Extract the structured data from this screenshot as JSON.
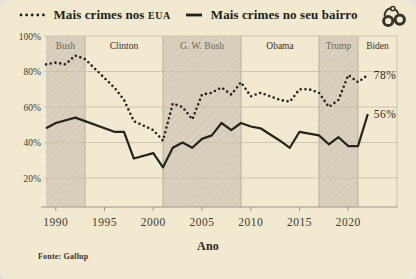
{
  "legend": {
    "icon": "handcuffs-icon",
    "series1": {
      "label": "Mais crimes nos",
      "suffix": "EUA"
    },
    "series2": {
      "label": "Mais crimes no seu bairro"
    }
  },
  "chart_data": {
    "type": "line",
    "xlabel": "Ano",
    "source": "Fonte: Gallup",
    "xlim": [
      1989,
      2025
    ],
    "ylim": [
      0,
      100
    ],
    "x_ticks": [
      1990,
      1995,
      2000,
      2005,
      2010,
      2015,
      2020
    ],
    "y_ticks": [
      20,
      40,
      60,
      80,
      100
    ],
    "y_tick_suffix": "%",
    "grid": "horizontal",
    "legend_position": "top",
    "bands": [
      {
        "label": "Bush",
        "start": 1989,
        "end": 1993,
        "shaded": true
      },
      {
        "label": "Clinton",
        "start": 1993,
        "end": 2001,
        "shaded": false
      },
      {
        "label": "G. W. Bush",
        "start": 2001,
        "end": 2009,
        "shaded": true
      },
      {
        "label": "Obama",
        "start": 2009,
        "end": 2017,
        "shaded": false
      },
      {
        "label": "Trump",
        "start": 2017,
        "end": 2021,
        "shaded": true
      },
      {
        "label": "Biden",
        "start": 2021,
        "end": 2025,
        "shaded": false
      }
    ],
    "series": [
      {
        "name": "Mais crimes nos EUA",
        "style": "dotted",
        "end_label": "78%",
        "points": [
          [
            1989,
            84
          ],
          [
            1990,
            85
          ],
          [
            1991,
            84
          ],
          [
            1992,
            89
          ],
          [
            1993,
            87
          ],
          [
            1996,
            71
          ],
          [
            1997,
            64
          ],
          [
            1998,
            52
          ],
          [
            2000,
            47
          ],
          [
            2001,
            41
          ],
          [
            2002,
            62
          ],
          [
            2003,
            60
          ],
          [
            2004,
            53
          ],
          [
            2005,
            67
          ],
          [
            2006,
            68
          ],
          [
            2007,
            71
          ],
          [
            2008,
            67
          ],
          [
            2009,
            74
          ],
          [
            2010,
            66
          ],
          [
            2011,
            68
          ],
          [
            2013,
            64
          ],
          [
            2014,
            63
          ],
          [
            2015,
            70
          ],
          [
            2016,
            70
          ],
          [
            2017,
            68
          ],
          [
            2018,
            60
          ],
          [
            2019,
            64
          ],
          [
            2020,
            78
          ],
          [
            2021,
            74
          ],
          [
            2022,
            78
          ]
        ]
      },
      {
        "name": "Mais crimes no seu bairro",
        "style": "solid",
        "end_label": "56%",
        "points": [
          [
            1989,
            48
          ],
          [
            1990,
            51
          ],
          [
            1992,
            54
          ],
          [
            1996,
            46
          ],
          [
            1997,
            46
          ],
          [
            1998,
            31
          ],
          [
            2000,
            34
          ],
          [
            2001,
            26
          ],
          [
            2002,
            37
          ],
          [
            2003,
            40
          ],
          [
            2004,
            37
          ],
          [
            2005,
            42
          ],
          [
            2006,
            44
          ],
          [
            2007,
            51
          ],
          [
            2008,
            47
          ],
          [
            2009,
            51
          ],
          [
            2010,
            49
          ],
          [
            2011,
            48
          ],
          [
            2013,
            41
          ],
          [
            2014,
            37
          ],
          [
            2015,
            46
          ],
          [
            2016,
            45
          ],
          [
            2017,
            44
          ],
          [
            2018,
            39
          ],
          [
            2019,
            43
          ],
          [
            2020,
            38
          ],
          [
            2021,
            38
          ],
          [
            2022,
            56
          ]
        ]
      }
    ],
    "colors": {
      "background": "#f1ead1",
      "line": "#26221c",
      "band": "#d9d1bd",
      "band_hatch": "#d0c8b3",
      "band_edge": "#b3ab96",
      "grid": "#c7c1ac",
      "axis": "#9e9788",
      "tick_label": "#43392c",
      "president_shaded": "#6e675a",
      "president_light": "#37322a",
      "end_label": "#2e2a22"
    }
  }
}
